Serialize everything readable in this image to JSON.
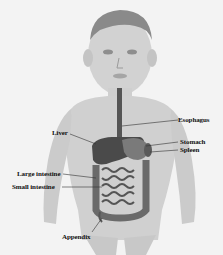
{
  "diagram": {
    "labels": {
      "esophagus": "Esophagus",
      "liver": "Liver",
      "stomach": "Stomach",
      "spleen": "Spleen",
      "large_intestine": "Large intestine",
      "small_intestine": "Small intestine",
      "appendix": "Appendix"
    }
  }
}
